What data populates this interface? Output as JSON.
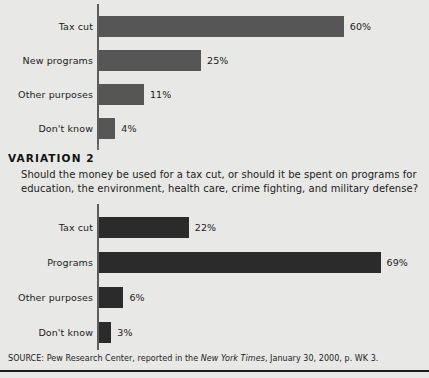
{
  "figure": {
    "background_color": "#e8e8e6",
    "axis_color": "#5d5d5d"
  },
  "variation": {
    "title": "VARIATION 2",
    "question": "Should the money be used for a tax cut, or should it be spent on programs for education, the environment, health care, crime fighting, and military defense?"
  },
  "source": {
    "prefix": "SOURCE: Pew Research Center, reported in the ",
    "publication": "New York Times",
    "suffix": ", January 30, 2000, p. WK 3."
  },
  "chart_data": [
    {
      "type": "bar",
      "orientation": "horizontal",
      "id": "variation-1-chart",
      "title": "",
      "xlabel": "",
      "ylabel": "",
      "xlim": [
        0,
        70
      ],
      "grid": false,
      "legend": "none",
      "bar_color": "#565656",
      "categories": [
        "Tax cut",
        "New programs",
        "Other purposes",
        "Don't know"
      ],
      "values": [
        60,
        25,
        11,
        4
      ],
      "value_labels": [
        "60%",
        "25%",
        "11%",
        "4%"
      ]
    },
    {
      "type": "bar",
      "orientation": "horizontal",
      "id": "variation-2-chart",
      "title": "",
      "xlabel": "",
      "ylabel": "",
      "xlim": [
        0,
        70
      ],
      "grid": false,
      "legend": "none",
      "bar_color": "#2b2b2b",
      "categories": [
        "Tax cut",
        "Programs",
        "Other purposes",
        "Don't know"
      ],
      "values": [
        22,
        69,
        6,
        3
      ],
      "value_labels": [
        "22%",
        "69%",
        "6%",
        "3%"
      ]
    }
  ]
}
